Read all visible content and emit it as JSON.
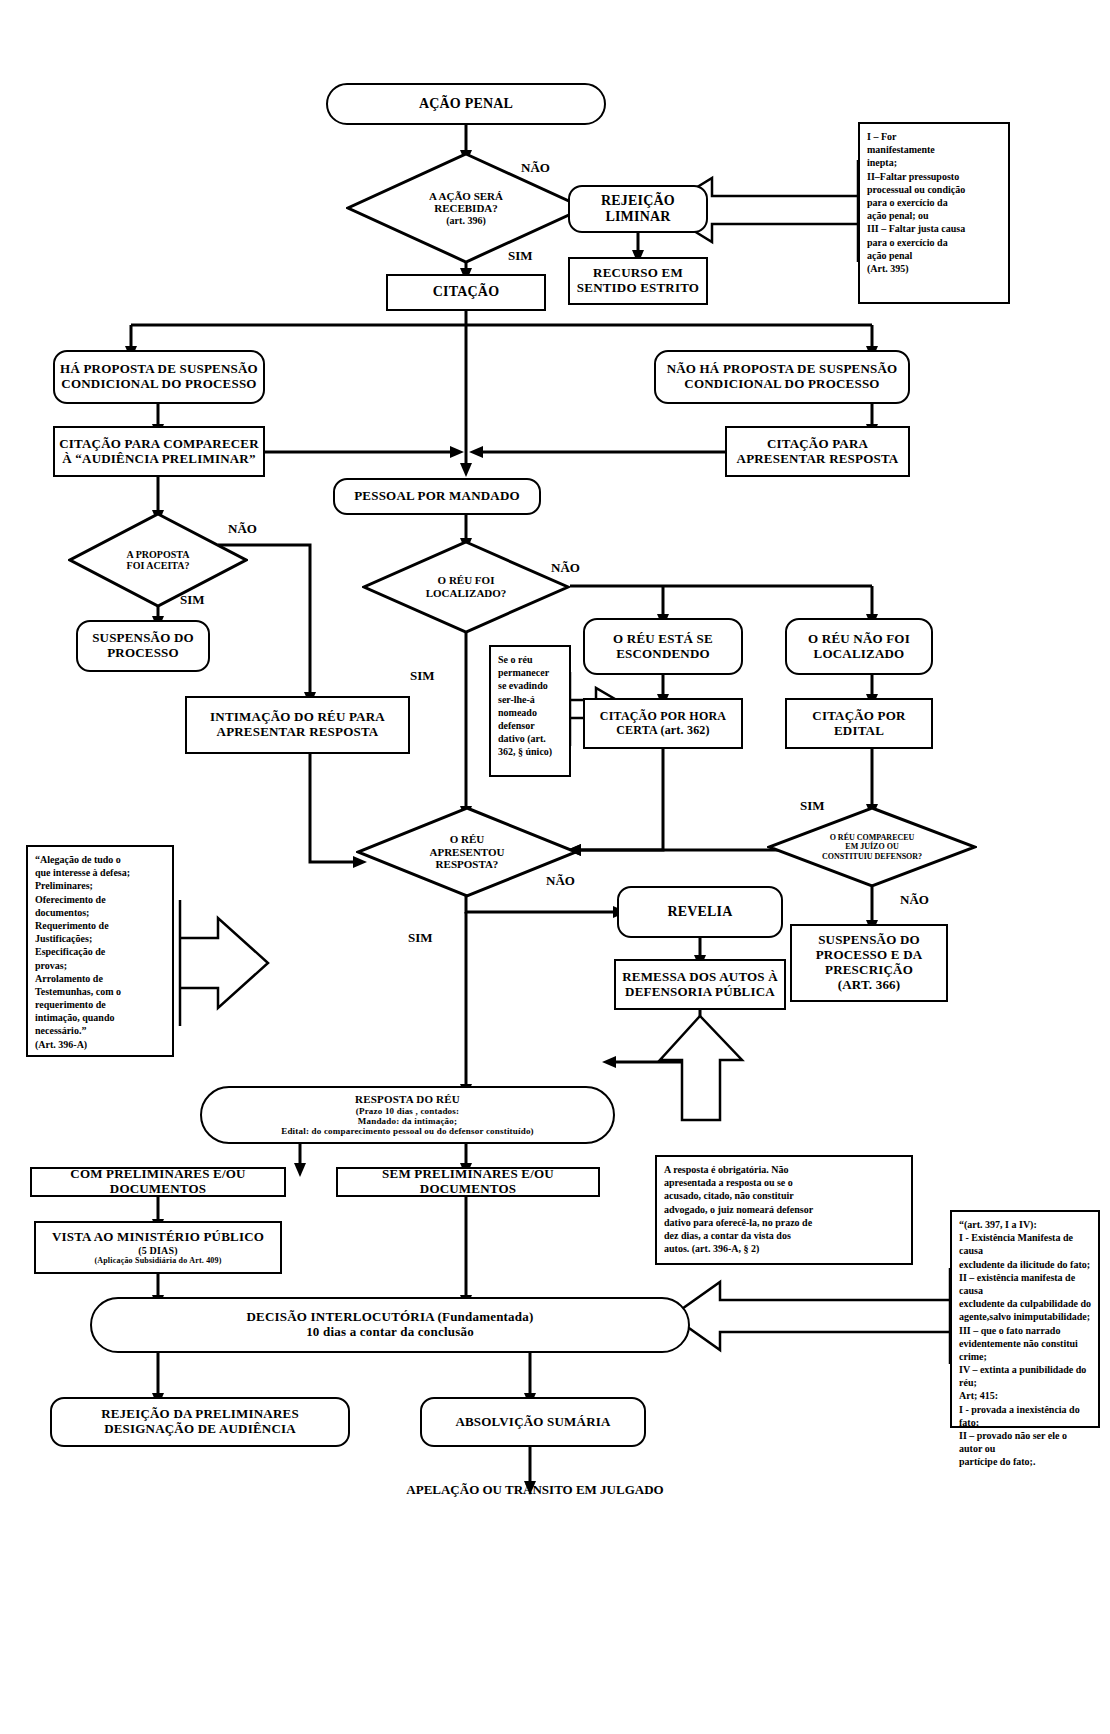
{
  "nodes": {
    "acao_penal": "AÇÃO PENAL",
    "acao_recebida_l1": "A AÇÃO SERÁ",
    "acao_recebida_l2": "RECEBIDA?",
    "acao_recebida_l3": "(art. 396)",
    "rejeicao_liminar_l1": "REJEIÇÃO",
    "rejeicao_liminar_l2": "LIMINAR",
    "recurso_l1": "RECURSO EM",
    "recurso_l2": "SENTIDO ESTRITO",
    "citacao": "CITAÇÃO",
    "ha_proposta_l1": "HÁ PROPOSTA DE SUSPENSÃO",
    "ha_proposta_l2": "CONDICIONAL DO PROCESSO",
    "nao_ha_proposta_l1": "NÃO HÁ PROPOSTA DE SUSPENSÃO",
    "nao_ha_proposta_l2": "CONDICIONAL DO PROCESSO",
    "citacao_comparecer_l1": "CITAÇÃO PARA COMPARECER",
    "citacao_comparecer_l2": "À “AUDIÊNCIA PRELIMINAR”",
    "citacao_resposta_l1": "CITAÇÃO PARA",
    "citacao_resposta_l2": "APRESENTAR RESPOSTA",
    "pessoal_mandado": "PESSOAL POR MANDADO",
    "proposta_aceita_l1": "A PROPOSTA",
    "proposta_aceita_l2": "FOI ACEITA?",
    "reu_localizado_l1": "O RÉU FOI",
    "reu_localizado_l2": "LOCALIZADO?",
    "suspensao_processo_l1": "SUSPENSÃO DO",
    "suspensao_processo_l2": "PROCESSO",
    "reu_escondendo_l1": "O RÉU ESTÁ SE",
    "reu_escondendo_l2": "ESCONDENDO",
    "reu_nao_localizado_l1": "O RÉU NÃO FOI",
    "reu_nao_localizado_l2": "LOCALIZADO",
    "intimacao_reu_l1": "INTIMAÇÃO DO RÉU PARA",
    "intimacao_reu_l2": "APRESENTAR RESPOSTA",
    "citacao_hora_certa_l1": "CITAÇÃO POR HORA",
    "citacao_hora_certa_l2": "CERTA (art. 362)",
    "citacao_edital_l1": "CITAÇÃO POR",
    "citacao_edital_l2": "EDITAL",
    "reu_apresentou_l1": "O RÉU",
    "reu_apresentou_l2": "APRESENTOU",
    "reu_apresentou_l3": "RESPOSTA?",
    "reu_compareceu_l1": "O RÉU COMPARECEU",
    "reu_compareceu_l2": "EM JUÍZO OU",
    "reu_compareceu_l3": "CONSTITUIU DEFENSOR?",
    "revelia": "REVELIA",
    "remessa_l1": "REMESSA DOS AUTOS À",
    "remessa_l2": "DEFENSORIA PÚBLICA",
    "suspensao_prescricao_l1": "SUSPENSÃO DO",
    "suspensao_prescricao_l2": "PROCESSO E DA",
    "suspensao_prescricao_l3": "PRESCRIÇÃO",
    "suspensao_prescricao_l4": "(ART. 366)",
    "resposta_reu_l1": "RESPOSTA DO RÉU",
    "resposta_reu_l2": "(Prazo 10 dias , contados:",
    "resposta_reu_l3": "Mandado: da intimação;",
    "resposta_reu_l4": "Edital: do comparecimento pessoal ou do defensor constituído)",
    "com_preliminares": "COM PRELIMINARES E/OU DOCUMENTOS",
    "sem_preliminares": "SEM PRELIMINARES E/OU DOCUMENTOS",
    "vista_mp_l1": "VISTA AO MINISTÉRIO PÚBLICO",
    "vista_mp_l2": "(5 DIAS)",
    "vista_mp_l3": "(Aplicação Subsidiária do Art. 409)",
    "decisao_l1": "DECISÃO INTERLOCUTÓRIA (Fundamentada)",
    "decisao_l2": "10 dias a contar da conclusão",
    "rejeicao_prelim_l1": "REJEIÇÃO DA PRELIMINARES",
    "rejeicao_prelim_l2": "DESIGNAÇÃO DE AUDIÊNCIA",
    "absolvicao": "ABSOLVIÇÃO SUMÁRIA",
    "apelacao": "APELAÇÃO OU TRÂNSITO EM JULGADO"
  },
  "edge_labels": {
    "nao_1": "NÃO",
    "sim_1": "SIM",
    "nao_2": "NÃO",
    "sim_2": "SIM",
    "nao_3": "NÃO",
    "sim_3": "SIM",
    "sim_4": "SIM",
    "nao_4": "NÃO",
    "sim_5": "SIM",
    "nao_5": "NÃO"
  },
  "notes": {
    "art395": "I – For manifestamente inepta; II–Faltar pressuposto processual ou condição para o exercício da ação penal; ou III – Faltar justa causa para o exercício da ação penal (Art. 395)",
    "art395_lines": [
      "I            –          For",
      "manifestamente",
      "inepta;",
      "II–Faltar  pressuposto",
      "processual ou condição",
      "para  o  exercício  da",
      "ação penal; ou",
      "III – Faltar justa causa",
      "para  o  exercício  da",
      "ação penal",
      "(Art. 395)"
    ],
    "se_o_reu_lines": [
      "Se o réu",
      "permanecer",
      "se evadindo",
      "ser-lhe-á",
      "nomeado",
      "defensor",
      "dativo (art.",
      "362, § único)"
    ],
    "art396a_lines": [
      "“Alegação de tudo o",
      "que interesse à defesa;",
      "Preliminares;",
      "Oferecimento de",
      "documentos;",
      "Requerimento de",
      "Justificações;",
      "Especificação de",
      "provas;",
      "Arrolamento de",
      "Testemunhas, com o",
      "requerimento de",
      "intimação, quando",
      "necessário.”",
      "(Art. 396-A)"
    ],
    "resposta_obrigatoria_lines": [
      "A  resposta  é  obrigatória.  Não",
      "apresentada  a  resposta  ou  se  o",
      "acusado,  citado,  não  constituir",
      "advogado, o juiz nomeará defensor",
      "dativo para oferecê-la, no prazo de",
      "dez dias, a contar da vista dos",
      "autos. (art. 396-A, § 2)"
    ],
    "art397_lines": [
      "“(art. 397, I a IV):",
      "I - Existência Manifesta de causa",
      "excludente da ilicitude do fato;",
      "II – existência manifesta de causa",
      "excludente da culpabilidade do",
      "agente,salvo inimputabilidade;",
      "III  –  que  o  fato  narrado",
      "evidentemente não constitui crime;",
      "IV – extinta a punibilidade do réu;",
      "Art; 415:",
      "I - provada a inexistência do fato;",
      "II – provado não ser ele o autor ou",
      "partícipe do fato;."
    ]
  },
  "colors": {
    "stroke": "#000000",
    "background": "#ffffff"
  }
}
